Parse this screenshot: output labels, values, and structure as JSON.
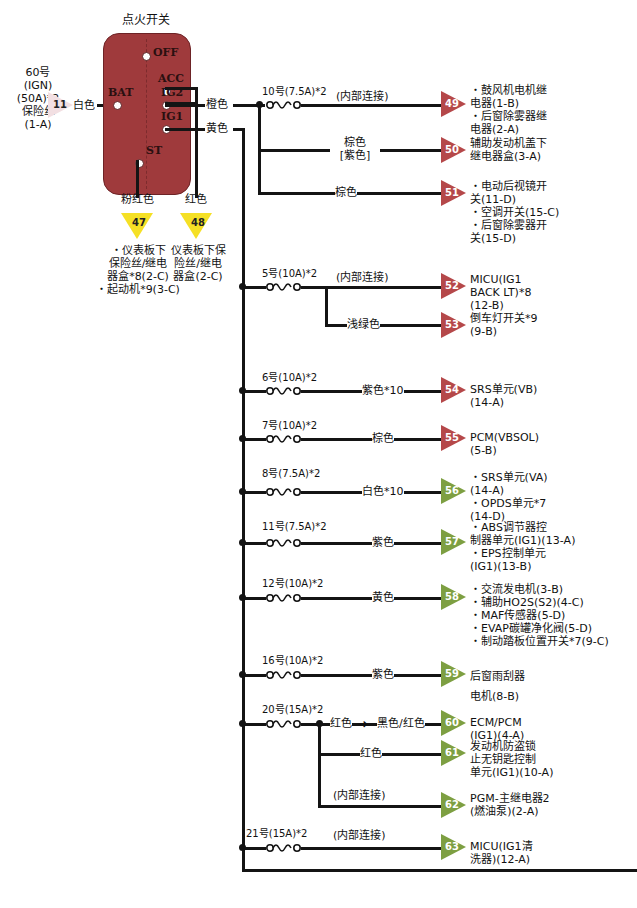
{
  "diagram": {
    "title": "点火开关",
    "switch": {
      "terminals": [
        "OFF",
        "ACC",
        "BAT",
        "IG2",
        "IG1",
        "ST"
      ],
      "color": "#9f3a3c"
    },
    "source": {
      "label": "60号\n(IGN)\n(50A)*2\n保险丝\n(1-A)",
      "connector_id": "11",
      "wire_color": "白色"
    },
    "down_connectors": [
      {
        "id": "47",
        "wire_color": "粉红色",
        "desc": "・仪表板下\n保险丝/继电\n器盒*8(2-C)\n・起动机*9(3-C)"
      },
      {
        "id": "48",
        "wire_color": "红色",
        "desc": "仪表板下保\n险丝/继电\n器盒(2-C)"
      }
    ],
    "switch_outputs": [
      {
        "terminal": "IG2",
        "wire_color": "橙色"
      },
      {
        "terminal": "IG1",
        "wire_color": "黄色"
      }
    ],
    "branches": [
      {
        "fuse": "10号(7.5A)*2",
        "taps": [
          {
            "id": "49",
            "tri": "red",
            "wire_color": "(内部连接)",
            "desc": "・鼓风机电机继\n电器(1-B)\n・后窗除雾器继\n电器(2-A)"
          },
          {
            "id": "50",
            "tri": "red",
            "wire_color": "棕色\n[紫色]",
            "desc": "辅助发动机盖下\n继电器盒(3-A)"
          },
          {
            "id": "51",
            "tri": "red",
            "wire_color": "棕色",
            "desc": "・电动后视镜开\n关(11-D)\n・空调开关(15-C)\n・后窗除雾器开\n关(15-D)"
          }
        ]
      },
      {
        "fuse": "5号(10A)*2",
        "taps": [
          {
            "id": "52",
            "tri": "red",
            "wire_color": "(内部连接)",
            "desc": "MICU(IG1\nBACK LT)*8\n(12-B)"
          },
          {
            "id": "53",
            "tri": "red",
            "wire_color": "浅绿色",
            "desc": "倒车灯开关*9\n(9-B)"
          }
        ]
      },
      {
        "fuse": "6号(10A)*2",
        "taps": [
          {
            "id": "54",
            "tri": "red",
            "wire_color": "紫色*10",
            "desc": "SRS单元(VB)\n(14-A)"
          }
        ]
      },
      {
        "fuse": "7号(10A)*2",
        "taps": [
          {
            "id": "55",
            "tri": "red",
            "wire_color": "棕色",
            "desc": "PCM(VBSOL)\n(5-B)"
          }
        ]
      },
      {
        "fuse": "8号(7.5A)*2",
        "taps": [
          {
            "id": "56",
            "tri": "green",
            "wire_color": "白色*10",
            "desc": "・SRS单元(VA)\n(14-A)\n・OPDS单元*7\n(14-D)"
          }
        ]
      },
      {
        "fuse": "11号(7.5A)*2",
        "taps": [
          {
            "id": "57",
            "tri": "green",
            "wire_color": "紫色",
            "desc": "・ABS调节器控\n制器单元(IG1)(13-A)\n・EPS控制单元\n(IG1)(13-B)"
          }
        ]
      },
      {
        "fuse": "12号(10A)*2",
        "taps": [
          {
            "id": "58",
            "tri": "green",
            "wire_color": "黄色",
            "desc": "・交流发电机(3-B)\n・辅助HO2S(S2)(4-C)\n・MAF传感器(5-D)\n・EVAP碳罐净化阀(5-D)\n・制动踏板位置开关*7(9-C)"
          }
        ]
      },
      {
        "fuse": "16号(10A)*2",
        "taps": [
          {
            "id": "59",
            "tri": "green",
            "wire_color": "紫色",
            "desc": "后窗雨刮器\n电机(8-B)"
          }
        ]
      },
      {
        "fuse": "20号(15A)*2",
        "taps": [
          {
            "id": "60",
            "tri": "green",
            "wire_color": "红色",
            "wire_color2": "黑色/红色",
            "desc": "ECM/PCM\n(IG1)(4-A)"
          },
          {
            "id": "61",
            "tri": "green",
            "wire_color": "红色",
            "desc": "发动机防盗锁\n止无钥匙控制\n单元(IG1)(10-A)"
          },
          {
            "id": "62",
            "tri": "green",
            "wire_color": "(内部连接)",
            "desc": "PGM-主继电器2\n(燃油泵)(2-A)"
          }
        ]
      },
      {
        "fuse": "21号(15A)*2",
        "taps": [
          {
            "id": "63",
            "tri": "green",
            "wire_color": "(内部连接)",
            "desc": "MICU(IG1清\n洗器)(12-A)"
          }
        ]
      }
    ],
    "colors": {
      "red_triangle": "#b5484a",
      "green_triangle": "#7d9f42",
      "yellow_triangle": "#f5e025",
      "pink_triangle": "#f2dfe2",
      "switch_body": "#9f3a3c",
      "wire": "#141414"
    }
  }
}
